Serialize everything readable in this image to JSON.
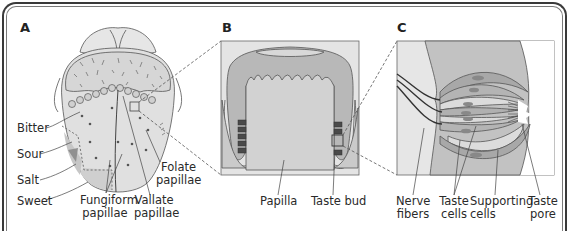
{
  "panels": {
    "a": {
      "letter": "A"
    },
    "b": {
      "letter": "B"
    },
    "c": {
      "letter": "C"
    }
  },
  "tongue_labels": {
    "bitter": "Bitter",
    "sour": "Sour",
    "salt": "Salt",
    "sweet": "Sweet",
    "fungiform_1": "Fungiform",
    "fungiform_2": "papillae",
    "vallate_1": "Vallate",
    "vallate_2": "papillae",
    "folate_1": "Folate",
    "folate_2": "papillae"
  },
  "papilla_labels": {
    "papilla": "Papilla",
    "taste_bud": "Taste bud"
  },
  "bud_labels": {
    "nerve_1": "Nerve",
    "nerve_2": "fibers",
    "taste_cells_1": "Taste",
    "taste_cells_2": "cells",
    "supporting_1": "Supporting",
    "supporting_2": "cells",
    "pore_1": "Taste",
    "pore_2": "pore"
  },
  "colors": {
    "frame": "#3a3a3a",
    "tissue_light": "#e3e3e3",
    "tissue_mid": "#c4c4c4",
    "tissue_dark": "#a8a8a8",
    "nucleus": "#8a8a8a",
    "outline": "#555555"
  }
}
